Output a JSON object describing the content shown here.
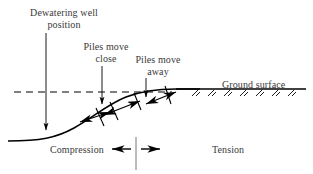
{
  "figure": {
    "type": "engineering-cross-section-diagram",
    "background_color": "#ffffff",
    "line_color": "#000000",
    "text_color": "#3a3a3a"
  },
  "labels": {
    "dewatering_well_line1": "Dewatering well",
    "dewatering_well_line2": "position",
    "piles_close_line1": "Piles move",
    "piles_close_line2": "close",
    "piles_away_line1": "Piles move",
    "piles_away_line2": "away",
    "ground_surface": "Ground surface",
    "compression": "Compression",
    "tension": "Tension"
  },
  "elements": {
    "original_level_line_style": "dashed",
    "settlement_curve_style": "solid",
    "ground_hatching_count": 7,
    "pile_tick_count": 4,
    "displacement_arrow_count": 3,
    "zone_divider": "vertical-line"
  }
}
